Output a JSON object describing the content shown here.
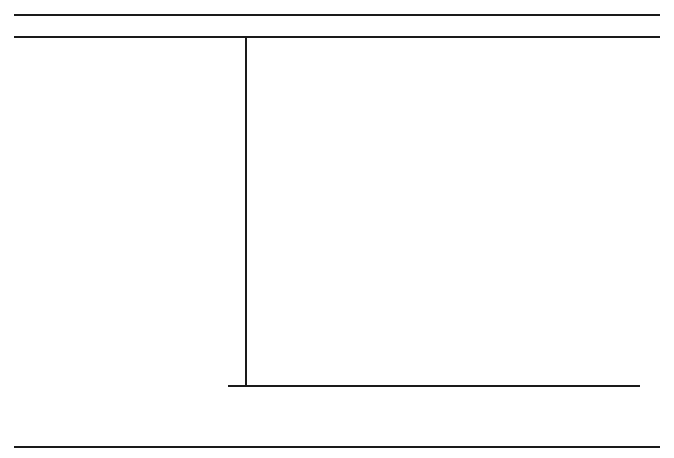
{
  "chart_data": {
    "type": "bar",
    "orientation": "horizontal",
    "title": "",
    "xlabel": "Percent of Calories from Fat",
    "ylabel": "Food Items",
    "xlim": [
      0,
      100
    ],
    "xticks": [
      0,
      10,
      20,
      30,
      40,
      50,
      60,
      70,
      80,
      90,
      100
    ],
    "xtick_labels": [
      "0",
      "10",
      "20",
      "30",
      "40",
      "50",
      "60",
      "70",
      "80",
      "90",
      "100"
    ],
    "grid": false,
    "legend": false,
    "bar_color": "#000000",
    "categories": [
      "Vegetable oil, shortening",
      "Butter, margarine",
      "Mayonnaise, salad dressing",
      "Walnuts, pecans, cashews, almonds",
      "Chocolates",
      "Peanut butter, whole milk",
      "Cooked pork sausage",
      "American cheese, beef, lamb, veal",
      "Ice cream, poultry, doughnuts,\ncookies, cakes, pies",
      "Fish",
      "Cereal, bread, brans",
      "Fruits, vegetables"
    ],
    "values": [
      100,
      81,
      80,
      64,
      53,
      50,
      45,
      32,
      20,
      15,
      10,
      0
    ],
    "value_labels": [
      "100%",
      "81%",
      "80%",
      "64%",
      "53%",
      "50%",
      "45%",
      "32%",
      "20%",
      "15%",
      "10%",
      "0%"
    ]
  }
}
